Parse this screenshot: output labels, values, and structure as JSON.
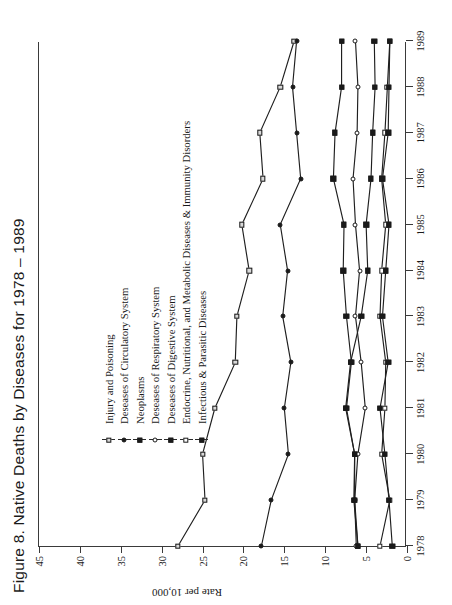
{
  "figure": {
    "title": "Figure 8.  Native Deaths by Diseases for 1978 – 1989"
  },
  "axes": {
    "ylabel": "Rate per 10,000",
    "yticks": [
      "0",
      "5",
      "10",
      "15",
      "20",
      "25",
      "30",
      "35",
      "40",
      "45"
    ],
    "xticks": [
      "1978",
      "1979",
      "1980",
      "1981",
      "1982",
      "1983",
      "1984",
      "1985",
      "1986",
      "1987",
      "1988",
      "1989"
    ]
  },
  "legend": {
    "items": [
      {
        "label": "Injury and Poisoning",
        "marker": "sq-open"
      },
      {
        "label": "Deseases of Circulatory System",
        "marker": "ci-fill"
      },
      {
        "label": "Neoplasms",
        "marker": "sq-fill"
      },
      {
        "label": "Deseases of Respiratory System",
        "marker": "ci-open"
      },
      {
        "label": "Deseases of Digestive System",
        "marker": "sq-fill"
      },
      {
        "label": "Endocrine, Nutritional, and Metabolic Diseases & Immunity Disorders",
        "marker": "sq-white"
      },
      {
        "label": "Infectious & Parasitic Diseases",
        "marker": "sq-fill"
      }
    ]
  },
  "chart_data": {
    "type": "line",
    "title": "Figure 8.  Native Deaths by Diseases for 1978 – 1989",
    "xlabel": "",
    "ylabel": "Rate per 10,000",
    "x": [
      1978,
      1979,
      1980,
      1981,
      1982,
      1983,
      1984,
      1985,
      1986,
      1987,
      1988,
      1989
    ],
    "ylim": [
      0,
      45
    ],
    "ytick_step": 5,
    "grid": false,
    "legend_position": "upper-left",
    "series": [
      {
        "name": "Injury and Poisoning",
        "marker": "sq-open",
        "values": [
          28.0,
          24.7,
          25.0,
          23.5,
          21.0,
          20.8,
          19.3,
          20.2,
          17.6,
          18.0,
          15.5,
          13.8
        ]
      },
      {
        "name": "Deseases of Circulatory System",
        "marker": "ci-fill",
        "values": [
          17.8,
          16.6,
          14.5,
          15.0,
          14.2,
          15.2,
          14.6,
          15.5,
          13.0,
          13.5,
          14.0,
          13.5
        ]
      },
      {
        "name": "Neoplasms",
        "marker": "sq-fill",
        "values": [
          6.0,
          6.5,
          6.4,
          7.4,
          6.8,
          7.4,
          7.8,
          7.7,
          9.0,
          8.8,
          8.0,
          8.0
        ]
      },
      {
        "name": "Deseases of Respiratory System",
        "marker": "ci-open",
        "values": [
          6.2,
          6.4,
          6.0,
          5.1,
          5.6,
          6.3,
          5.8,
          6.3,
          6.6,
          6.1,
          6.0,
          6.3
        ]
      },
      {
        "name": "Deseases of Digestive System",
        "marker": "sq-fill",
        "values": [
          6.0,
          6.4,
          6.4,
          7.5,
          6.9,
          5.6,
          4.8,
          5.0,
          4.4,
          4.2,
          3.9,
          4.0
        ]
      },
      {
        "name": "Endocrine, Nutritional, and Metabolic Diseases & Immunity Disorders",
        "marker": "sq-white",
        "values": [
          3.3,
          2.1,
          3.1,
          2.7,
          2.6,
          3.3,
          3.1,
          2.6,
          3.1,
          2.7,
          2.4,
          2.1
        ]
      },
      {
        "name": "Infectious & Parasitic Diseases",
        "marker": "sq-fill",
        "values": [
          1.8,
          2.2,
          2.7,
          3.3,
          2.3,
          3.0,
          2.6,
          2.2,
          3.0,
          2.3,
          2.2,
          2.1
        ]
      }
    ]
  }
}
